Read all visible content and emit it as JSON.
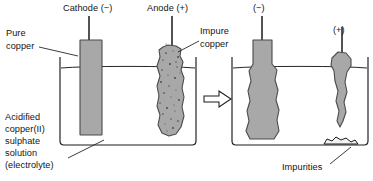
{
  "figure": {
    "type": "process-diagram",
    "background_color": "#ffffff",
    "line_color": "#1a1a1a",
    "electrode_fill": "#a8a8a8",
    "electrode_stroke": "#555555",
    "impure_speckle_color": "#4d4d4d"
  },
  "labels": {
    "cathode": "Cathode (−)",
    "anode": "Anode (+)",
    "pure_copper_line1": "Pure",
    "pure_copper_line2": "copper",
    "impure_copper_line1": "Impure",
    "impure_copper_line2": "copper",
    "electrolyte_line1": "Acidified",
    "electrolyte_line2": "copper(II)",
    "electrolyte_line3": "sulphate",
    "electrolyte_line4": "solution",
    "electrolyte_line5": "(electrolyte)",
    "right_negative": "(−)",
    "right_positive": "(+)",
    "impurities": "Impurities"
  },
  "diagrams": [
    {
      "name": "before",
      "beaker": {
        "x": 60,
        "y": 57,
        "width": 136,
        "height": 88
      },
      "liquid_level_y": 68,
      "electrodes": [
        {
          "name": "cathode",
          "state": "pure-copper-bar",
          "polarity": "−",
          "shape": "smooth-rectangle"
        },
        {
          "name": "anode",
          "state": "impure-copper-block",
          "polarity": "+",
          "shape": "rough-speckled"
        }
      ]
    },
    {
      "name": "after",
      "beaker": {
        "x": 232,
        "y": 57,
        "width": 136,
        "height": 88
      },
      "liquid_level_y": 68,
      "electrodes": [
        {
          "name": "cathode",
          "state": "thickened",
          "polarity": "−",
          "shape": "grown-bar"
        },
        {
          "name": "anode",
          "state": "eroded",
          "polarity": "+",
          "shape": "thinned-taper"
        }
      ],
      "sediment": {
        "name": "impurities",
        "position": "beaker-floor-right"
      }
    }
  ],
  "arrow": {
    "name": "process-arrow",
    "direction": "right",
    "style": "hollow-outline"
  }
}
